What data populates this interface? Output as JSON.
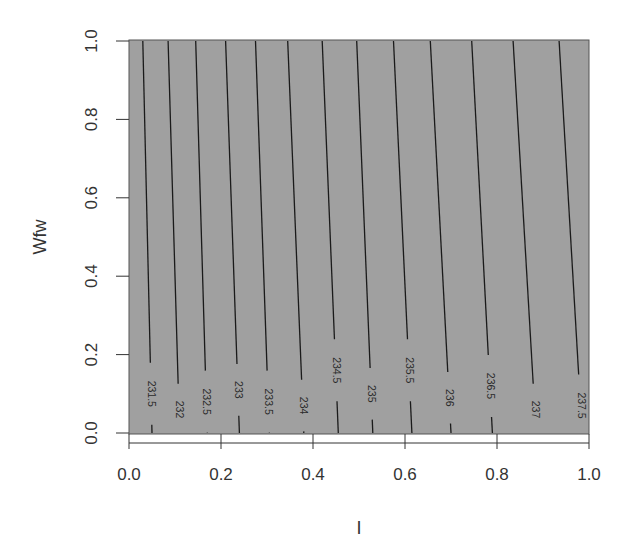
{
  "chart_data": {
    "type": "contour",
    "title": "",
    "xlabel": "I",
    "ylabel": "Wfw",
    "xlim": [
      0.0,
      1.0
    ],
    "ylim": [
      0.0,
      1.0
    ],
    "x_ticks": [
      "0.0",
      "0.2",
      "0.4",
      "0.6",
      "0.8",
      "1.0"
    ],
    "y_ticks": [
      "0.0",
      "0.2",
      "0.4",
      "0.6",
      "0.8",
      "1.0"
    ],
    "grid": false,
    "legend": null,
    "background_fill": "#a0a0a0",
    "line_color": "#1a1a1a",
    "contours": [
      {
        "level": "231.5",
        "x_at_wfw_1": 0.03,
        "x_at_wfw_0": 0.05,
        "label_wfw": 0.1
      },
      {
        "level": "232",
        "x_at_wfw_1": 0.085,
        "x_at_wfw_0": 0.11,
        "label_wfw": 0.06
      },
      {
        "level": "232.5",
        "x_at_wfw_1": 0.145,
        "x_at_wfw_0": 0.17,
        "label_wfw": 0.08
      },
      {
        "level": "233",
        "x_at_wfw_1": 0.21,
        "x_at_wfw_0": 0.24,
        "label_wfw": 0.11
      },
      {
        "level": "233.5",
        "x_at_wfw_1": 0.275,
        "x_at_wfw_0": 0.305,
        "label_wfw": 0.08
      },
      {
        "level": "234",
        "x_at_wfw_1": 0.345,
        "x_at_wfw_0": 0.38,
        "label_wfw": 0.07
      },
      {
        "level": "234.5",
        "x_at_wfw_1": 0.42,
        "x_at_wfw_0": 0.455,
        "label_wfw": 0.16
      },
      {
        "level": "235",
        "x_at_wfw_1": 0.495,
        "x_at_wfw_0": 0.53,
        "label_wfw": 0.1
      },
      {
        "level": "235.5",
        "x_at_wfw_1": 0.575,
        "x_at_wfw_0": 0.615,
        "label_wfw": 0.16
      },
      {
        "level": "236",
        "x_at_wfw_1": 0.655,
        "x_at_wfw_0": 0.7,
        "label_wfw": 0.09
      },
      {
        "level": "236.5",
        "x_at_wfw_1": 0.745,
        "x_at_wfw_0": 0.79,
        "label_wfw": 0.12
      },
      {
        "level": "237",
        "x_at_wfw_1": 0.835,
        "x_at_wfw_0": 0.885,
        "label_wfw": 0.06
      },
      {
        "level": "237.5",
        "x_at_wfw_1": 0.935,
        "x_at_wfw_0": 0.985,
        "label_wfw": 0.07
      }
    ]
  }
}
